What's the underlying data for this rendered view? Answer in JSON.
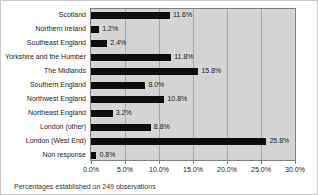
{
  "chart_data": {
    "type": "bar",
    "orientation": "horizontal",
    "title": "",
    "categories": [
      "Scotland",
      "Northern Ireland",
      "Southeast England",
      "Yorkshire and the Humber",
      "The Midlands",
      "Southern England",
      "Northwest England",
      "Northeast England",
      "London (other)",
      "London (West End)",
      "Non response"
    ],
    "values": [
      11.6,
      1.2,
      2.4,
      11.8,
      15.8,
      8.0,
      10.8,
      3.2,
      8.8,
      25.8,
      0.8
    ],
    "value_labels": [
      "11.6%",
      "1.2%",
      "2.4%",
      "11.8%",
      "15.8%",
      "8.0%",
      "10.8%",
      "3.2%",
      "8.8%",
      "25.8%",
      "0.8%"
    ],
    "xlim": [
      0,
      30
    ],
    "x_tick_step": 5,
    "x_tick_labels": [
      "0.0%",
      "5.0%",
      "10.0%",
      "15.0%",
      "20.0%",
      "25.0%",
      "30.0%"
    ],
    "grid": "vertical",
    "legend": "none",
    "bar_color": "#0d0d0d",
    "plot_bg": "#d4d4d4"
  },
  "caption": "Percentages established on 249 observations"
}
